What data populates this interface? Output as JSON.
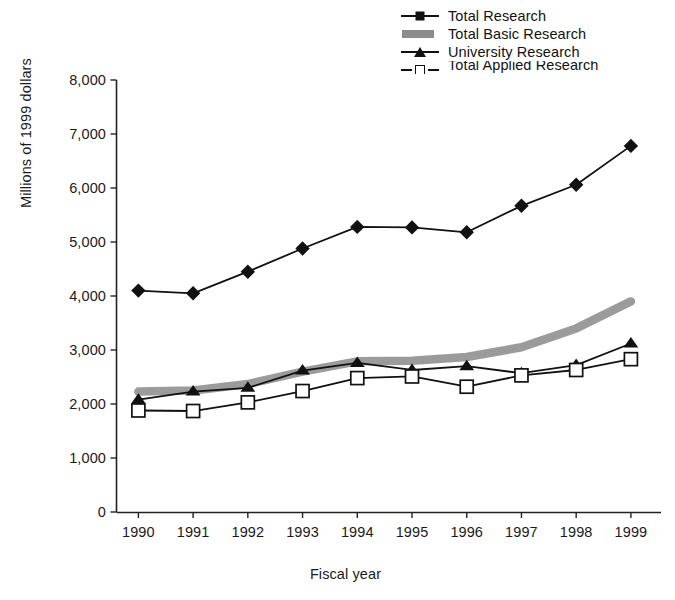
{
  "chart_data": {
    "type": "line",
    "title": "",
    "xlabel": "Fiscal year",
    "ylabel": "Millions of 1999 dollars",
    "categories": [
      "1990",
      "1991",
      "1992",
      "1993",
      "1994",
      "1995",
      "1996",
      "1997",
      "1998",
      "1999"
    ],
    "x": [
      1990,
      1991,
      1992,
      1993,
      1994,
      1995,
      1996,
      1997,
      1998,
      1999
    ],
    "xlim": [
      1989.6,
      1999.55
    ],
    "ylim": [
      0,
      8000
    ],
    "ytick_labels": [
      "0",
      "1,000",
      "2,000",
      "3,000",
      "4,000",
      "5,000",
      "6,000",
      "7,000",
      "8,000"
    ],
    "ytick_values": [
      0,
      1000,
      2000,
      3000,
      4000,
      5000,
      6000,
      7000,
      8000
    ],
    "grid": false,
    "legend_position": "top-right",
    "series": [
      {
        "name": "Total Research",
        "marker": "diamond-filled",
        "color": "#111111",
        "values": [
          4100,
          4050,
          4450,
          4880,
          5280,
          5270,
          5180,
          5670,
          6060,
          6780
        ]
      },
      {
        "name": "Total Basic Research",
        "marker": "band",
        "color": "#8d8d8d",
        "values": [
          2230,
          2250,
          2370,
          2600,
          2790,
          2800,
          2870,
          3050,
          3400,
          3900
        ]
      },
      {
        "name": "University Research",
        "marker": "triangle-filled",
        "color": "#111111",
        "values": [
          2080,
          2230,
          2300,
          2620,
          2760,
          2630,
          2700,
          2570,
          2720,
          3120
        ]
      },
      {
        "name": "Total Applied Research",
        "marker": "square-open",
        "color": "#111111",
        "values": [
          1880,
          1870,
          2030,
          2240,
          2480,
          2510,
          2320,
          2530,
          2630,
          2830
        ]
      }
    ]
  },
  "legend": {
    "items": [
      {
        "label": "Total Research",
        "key": "line-diamond"
      },
      {
        "label": "Total Basic Research",
        "key": "gray-band"
      },
      {
        "label": "University Research",
        "key": "line-triangle"
      },
      {
        "label": "Total Applied Research",
        "key": "line-square"
      }
    ]
  },
  "axes": {
    "x_title": "Fiscal year",
    "y_title": "Millions of 1999 dollars"
  }
}
